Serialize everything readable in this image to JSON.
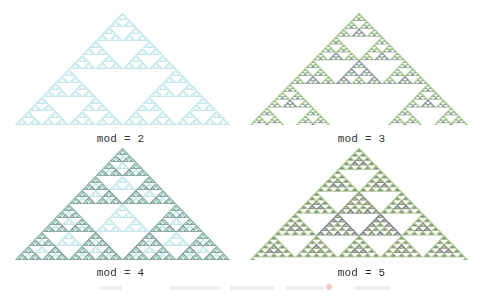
{
  "figure": {
    "panels": [
      {
        "label": "mod = 2",
        "mod": 2,
        "rows": 128,
        "apex": [
          122,
          13
        ],
        "base_y": 125,
        "base_x": [
          15,
          230
        ],
        "label_y": 133,
        "colors": {
          "1": "#bfe6ea"
        }
      },
      {
        "label": "mod = 3",
        "mod": 3,
        "rows": 128,
        "apex": [
          358,
          13
        ],
        "base_y": 125,
        "base_x": [
          250,
          468
        ],
        "label_y": 133,
        "colors": {
          "1": "#a9cf8f",
          "2": "#8c95a8"
        }
      },
      {
        "label": "mod = 4",
        "mod": 4,
        "rows": 128,
        "apex": [
          122,
          148
        ],
        "base_y": 260,
        "base_x": [
          15,
          230
        ],
        "label_y": 267,
        "colors": {
          "1": "#8fb8a0",
          "2": "#bfe6ea",
          "3": "#7f9a98"
        }
      },
      {
        "label": "mod = 5",
        "mod": 5,
        "rows": 128,
        "apex": [
          358,
          148
        ],
        "base_y": 260,
        "base_x": [
          250,
          468
        ],
        "label_y": 267,
        "colors": {
          "1": "#a7c98a",
          "2": "#8e9a7a",
          "3": "#7d8090",
          "4": "#b5c39a"
        }
      }
    ],
    "background": "#ffffff"
  },
  "caption": {
    "segments": [
      [
        0,
        22
      ],
      [
        70,
        120
      ],
      [
        130,
        175
      ],
      [
        185,
        225
      ],
      [
        255,
        290
      ]
    ],
    "marker_x": 226,
    "marker_color": "#f3c6c6"
  }
}
